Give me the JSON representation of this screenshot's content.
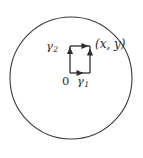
{
  "figure": {
    "kind": "math-diagram",
    "background_color": "#ffffff",
    "stroke_color": "#3a3a3a",
    "text_color": "#2b2b2b",
    "disk": {
      "name": "disk-boundary-circle",
      "center_x": 71,
      "center_y": 78,
      "radius": 61,
      "stroke_width": 1.1,
      "fill": "none"
    },
    "contour": {
      "name": "rectangular-contour",
      "left": 70,
      "top": 46,
      "right": 90,
      "bottom": 73,
      "stroke_width": 1.4,
      "edges": [
        {
          "id": "bottom",
          "label_key": "gamma1",
          "direction": "right"
        },
        {
          "id": "right",
          "label_key": "gamma1",
          "direction": "up"
        },
        {
          "id": "left",
          "label_key": "gamma2",
          "direction": "up"
        },
        {
          "id": "top",
          "label_key": "gamma2",
          "direction": "right"
        }
      ]
    },
    "labels": {
      "gamma2": {
        "base": "γ",
        "sub": "2"
      },
      "gamma1": {
        "base": "γ",
        "sub": "1"
      },
      "origin": "0",
      "point_xy": "(x, y)"
    }
  }
}
